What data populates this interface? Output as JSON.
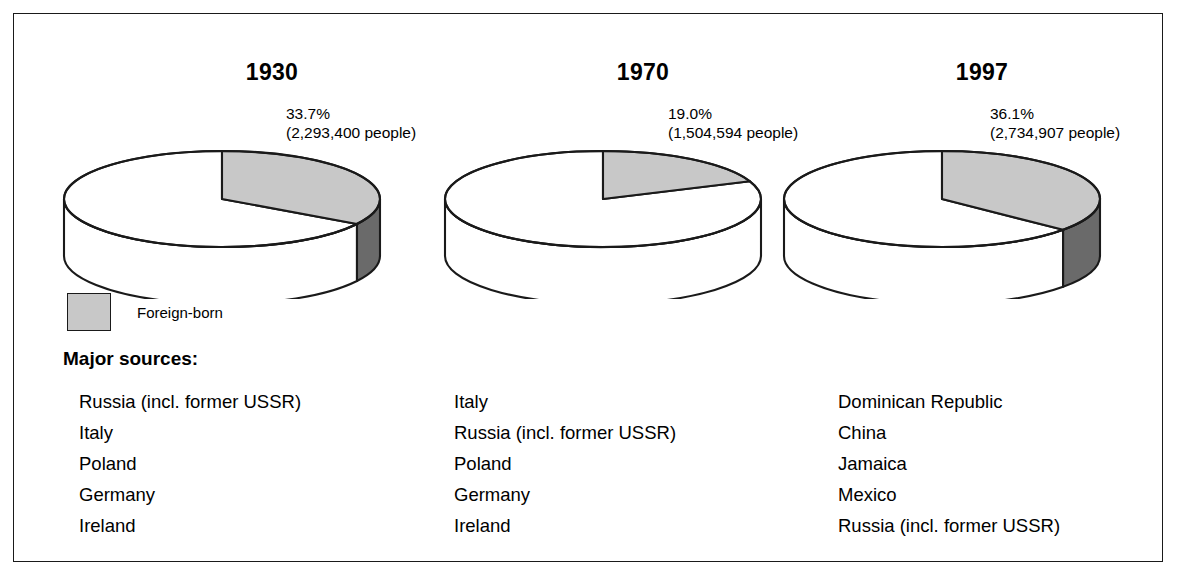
{
  "figure": {
    "legend": {
      "swatch_name": "foreign-born-swatch",
      "label": "Foreign-born",
      "swatch_color": "#c8c8c8"
    },
    "sources_heading": "Major sources:",
    "colors": {
      "slice_top": "#c8c8c8",
      "slice_wall": "#6a6a6a",
      "remainder_top": "#ffffff",
      "remainder_wall": "#ffffff",
      "outline": "#1a1a1a",
      "frame": "#1a1a1a",
      "background": "#ffffff",
      "text": "#000000"
    }
  },
  "chart_data": {
    "type": "pie",
    "title": "",
    "legend_position": "below-left",
    "series_label": "Foreign-born",
    "panels": [
      {
        "year": "1930",
        "percent_label": "33.7%",
        "count_label": "(2,293,400 people)",
        "percent_value": 33.7,
        "count_value": 2293400,
        "slices": [
          {
            "name": "Foreign-born",
            "value": 33.7,
            "color": "#c8c8c8"
          },
          {
            "name": "Other",
            "value": 66.3,
            "color": "#ffffff"
          }
        ],
        "major_sources": [
          "Russia (incl. former USSR)",
          "Italy",
          "Poland",
          "Germany",
          "Ireland"
        ]
      },
      {
        "year": "1970",
        "percent_label": "19.0%",
        "count_label": "(1,504,594 people)",
        "percent_value": 19.0,
        "count_value": 1504594,
        "slices": [
          {
            "name": "Foreign-born",
            "value": 19.0,
            "color": "#c8c8c8"
          },
          {
            "name": "Other",
            "value": 81.0,
            "color": "#ffffff"
          }
        ],
        "major_sources": [
          "Italy",
          "Russia (incl. former USSR)",
          "Poland",
          "Germany",
          "Ireland"
        ]
      },
      {
        "year": "1997",
        "percent_label": "36.1%",
        "count_label": "(2,734,907 people)",
        "percent_value": 36.1,
        "count_value": 2734907,
        "slices": [
          {
            "name": "Foreign-born",
            "value": 36.1,
            "color": "#c8c8c8"
          },
          {
            "name": "Other",
            "value": 63.9,
            "color": "#ffffff"
          }
        ],
        "major_sources": [
          "Dominican Republic",
          "China",
          "Jamaica",
          "Mexico",
          "Russia (incl. former USSR)"
        ]
      }
    ]
  }
}
